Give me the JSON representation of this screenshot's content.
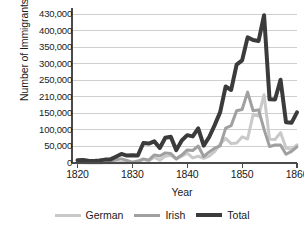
{
  "chart_data": {
    "type": "line",
    "title": "",
    "xlabel": "Year",
    "ylabel": "Number of Immigrants",
    "xlim": [
      1819,
      1860
    ],
    "ylim": [
      0,
      430000
    ],
    "grid": true,
    "legend_position": "bottom",
    "xticks": [
      1820,
      1830,
      1840,
      1850,
      1860
    ],
    "xtick_labels": [
      "1820",
      "1830",
      "1840",
      "1850",
      "1860"
    ],
    "yticks": [
      0,
      50000,
      100000,
      150000,
      210000,
      250000,
      300000,
      350000,
      400000,
      430000
    ],
    "ytick_labels": [
      "0",
      "50,000",
      "100,000",
      "150,000",
      "210,000",
      "250,000",
      "300,000",
      "350,000",
      "400,000",
      "430,000"
    ],
    "x": [
      1820,
      1821,
      1822,
      1823,
      1824,
      1825,
      1826,
      1827,
      1828,
      1829,
      1830,
      1831,
      1832,
      1833,
      1834,
      1835,
      1836,
      1837,
      1838,
      1839,
      1840,
      1841,
      1842,
      1843,
      1844,
      1845,
      1846,
      1847,
      1848,
      1849,
      1850,
      1851,
      1852,
      1853,
      1854,
      1855,
      1856,
      1857,
      1858,
      1859,
      1860
    ],
    "series": [
      {
        "name": "German",
        "color": "#c9c9c9",
        "width": 3,
        "values": [
          1000,
          400,
          150,
          200,
          200,
          450,
          500,
          430,
          1850,
          600,
          1950,
          2400,
          10200,
          6950,
          17700,
          8300,
          20700,
          23700,
          11700,
          21000,
          29700,
          15300,
          20400,
          14400,
          20700,
          34400,
          57600,
          74300,
          58500,
          60200,
          78900,
          72500,
          145900,
          141900,
          215000,
          71900,
          71000,
          91800,
          45300,
          41800,
          54500
        ]
      },
      {
        "name": "Irish",
        "color": "#a0a0a0",
        "width": 3,
        "values": [
          3600,
          10000,
          2300,
          1900,
          2300,
          4800,
          5400,
          9800,
          12500,
          7400,
          2700,
          5800,
          12400,
          8600,
          24500,
          20900,
          30600,
          28500,
          12600,
          23900,
          39400,
          37700,
          51300,
          19600,
          33500,
          44800,
          51700,
          105500,
          112900,
          159400,
          164000,
          221300,
          159500,
          162600,
          101600,
          49600,
          54300,
          54400,
          26400,
          35200,
          48600
        ]
      },
      {
        "name": "Total",
        "color": "#3b3b3b",
        "width": 4,
        "values": [
          8400,
          9100,
          6900,
          6400,
          7900,
          10200,
          10800,
          18900,
          27400,
          22500,
          23300,
          22600,
          60400,
          58600,
          65400,
          45400,
          76200,
          79300,
          38900,
          68100,
          84100,
          80300,
          104500,
          52500,
          78600,
          114400,
          154400,
          234900,
          226500,
          297000,
          310000,
          379500,
          371600,
          368600,
          427800,
          200900,
          200400,
          251300,
          123100,
          121300,
          153600
        ]
      }
    ],
    "annotations": []
  },
  "legend": {
    "items": [
      {
        "label": "German"
      },
      {
        "label": "Irish"
      },
      {
        "label": "Total"
      }
    ]
  },
  "colors": {
    "german": "#c9c9c9",
    "irish": "#a0a0a0",
    "total": "#3b3b3b",
    "axis": "#4a4a4a",
    "grid": "#cfcfcf",
    "background": "#ffffff"
  }
}
